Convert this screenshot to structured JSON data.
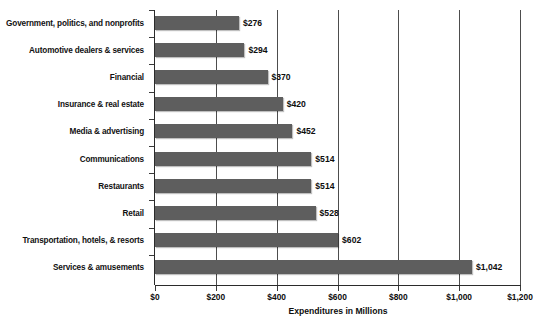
{
  "chart_data": {
    "type": "bar",
    "orientation": "horizontal",
    "title": "",
    "xlabel": "Expenditures in Millions",
    "ylabel": "",
    "xlim": [
      0,
      1200
    ],
    "xticks": [
      0,
      200,
      400,
      600,
      800,
      1000,
      1200
    ],
    "xtick_labels": [
      "$0",
      "$200",
      "$400",
      "$600",
      "$800",
      "$1,000",
      "$1,200"
    ],
    "grid": "vertical",
    "legend": null,
    "bar_color": "#5e5e5e",
    "categories": [
      "Government, politics, and nonprofits",
      "Automotive dealers & services",
      "Financial",
      "Insurance & real estate",
      "Media & advertising",
      "Communications",
      "Restaurants",
      "Retail",
      "Transportation, hotels, & resorts",
      "Services & amusements"
    ],
    "values": [
      276,
      294,
      370,
      420,
      452,
      514,
      514,
      528,
      602,
      1042
    ],
    "data_labels": [
      "$276",
      "$294",
      "$370",
      "$420",
      "$452",
      "$514",
      "$514",
      "$528",
      "$602",
      "$1,042"
    ]
  }
}
